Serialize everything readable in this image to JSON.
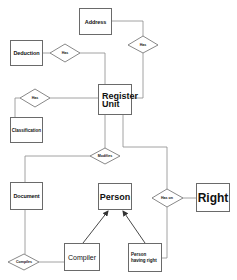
{
  "diagram": {
    "type": "entity-relationship",
    "entities": [
      {
        "id": "address",
        "label": "Address"
      },
      {
        "id": "deduction",
        "label": "Deduction"
      },
      {
        "id": "classification",
        "label": "Classification"
      },
      {
        "id": "register_unit",
        "label": "Register Unit"
      },
      {
        "id": "document",
        "label": "Document"
      },
      {
        "id": "person",
        "label": "Person"
      },
      {
        "id": "right",
        "label": "Right"
      },
      {
        "id": "compiler",
        "label": "Compiler"
      },
      {
        "id": "person_having_right",
        "label": "Person having right"
      }
    ],
    "relationships": [
      {
        "id": "has_deduction",
        "label": "Has",
        "from": "deduction",
        "to": "register_unit"
      },
      {
        "id": "has_address",
        "label": "Has",
        "from": "register_unit",
        "to": "address"
      },
      {
        "id": "has_classification",
        "label": "Has",
        "from": "classification",
        "to": "register_unit"
      },
      {
        "id": "modifies",
        "label": "Modifies",
        "from": "document",
        "to": "register_unit"
      },
      {
        "id": "has_on",
        "label": "Has on",
        "from": "person_having_right",
        "to": "right"
      },
      {
        "id": "compiles",
        "label": "Compiles",
        "from": "document",
        "to": "compiler"
      }
    ],
    "inheritance": [
      {
        "from": "compiler",
        "to": "person"
      },
      {
        "from": "person_having_right",
        "to": "person"
      }
    ]
  }
}
